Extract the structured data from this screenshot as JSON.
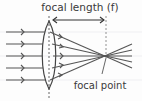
{
  "diagram": {
    "title_label": "focal length (f)",
    "focal_point_label": "focal point",
    "colors": {
      "ink": "#4a4a4a",
      "paper_lines": "#e6e6ea"
    },
    "elements": {
      "lens": "convex-lens",
      "incoming_rays": 5,
      "focal_length_arrow": "double-headed",
      "optical_axis": "dashed-vertical-lines"
    }
  }
}
